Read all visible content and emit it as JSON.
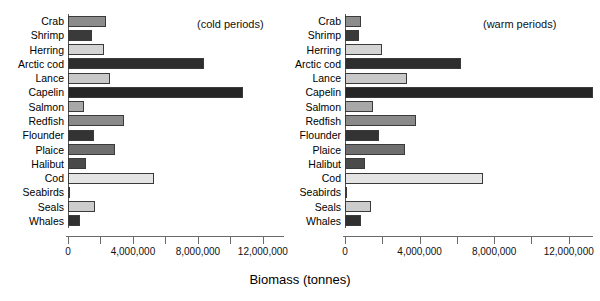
{
  "axis_title": "Biomass (tonnes)",
  "panels": [
    {
      "note": "(cold periods)",
      "key": "cold"
    },
    {
      "note": "(warm periods)",
      "key": "warm"
    }
  ],
  "tick_labels": [
    "0",
    "4,000,000",
    "8,000,000",
    "12,000,000"
  ],
  "chart_data": {
    "type": "bar",
    "orientation": "horizontal",
    "title": "",
    "xlabel": "Biomass (tonnes)",
    "ylabel": "",
    "xlim": [
      0,
      13300000
    ],
    "xticks": [
      0,
      2000000,
      4000000,
      6000000,
      8000000,
      10000000,
      12000000
    ],
    "xtick_labels": [
      "0",
      "",
      "4,000,000",
      "",
      "8,000,000",
      "",
      "12,000,000"
    ],
    "grid": false,
    "legend": "none",
    "panel_annotations": [
      "(cold periods)",
      "(warm periods)"
    ],
    "categories": [
      "Crab",
      "Shrimp",
      "Herring",
      "Arctic cod",
      "Lance",
      "Capelin",
      "Salmon",
      "Redfish",
      "Flounder",
      "Plaice",
      "Halibut",
      "Cod",
      "Seabirds",
      "Seals",
      "Whales"
    ],
    "series": [
      {
        "name": "cold periods",
        "values": [
          2350000,
          1450000,
          2200000,
          8400000,
          2600000,
          10800000,
          1000000,
          3450000,
          1600000,
          2900000,
          1100000,
          5300000,
          100000,
          1650000,
          750000
        ],
        "colors": [
          "#8c8c8c",
          "#3a3a3a",
          "#d4d4d4",
          "#2e2e2e",
          "#c9c9c9",
          "#262626",
          "#a8a8a8",
          "#8a8a8a",
          "#333333",
          "#6e6e6e",
          "#4a4a4a",
          "#e4e4e4",
          "#cfcfcf",
          "#cccccc",
          "#303030"
        ]
      },
      {
        "name": "warm periods",
        "values": [
          850000,
          750000,
          2000000,
          6200000,
          3300000,
          14500000,
          1500000,
          3800000,
          1800000,
          3200000,
          1050000,
          7400000,
          50000,
          1400000,
          850000
        ],
        "colors": [
          "#8c8c8c",
          "#3a3a3a",
          "#d4d4d4",
          "#2e2e2e",
          "#c9c9c9",
          "#262626",
          "#a8a8a8",
          "#8a8a8a",
          "#333333",
          "#6e6e6e",
          "#4a4a4a",
          "#e4e4e4",
          "#cfcfcf",
          "#cccccc",
          "#303030"
        ]
      }
    ]
  }
}
